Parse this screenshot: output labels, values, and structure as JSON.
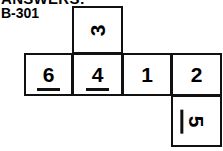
{
  "header": {
    "answers_heading": "ANSWERS:",
    "code_label": "B-301"
  },
  "diagram": {
    "type": "cube-net",
    "cells": [
      {
        "id": "3",
        "value": "3",
        "row": "top",
        "column": 2,
        "rotation": -90,
        "underlined": false
      },
      {
        "id": "6",
        "value": "6",
        "row": "middle",
        "column": 1,
        "rotation": 0,
        "underlined": true
      },
      {
        "id": "4",
        "value": "4",
        "row": "middle",
        "column": 2,
        "rotation": 0,
        "underlined": true
      },
      {
        "id": "1",
        "value": "1",
        "row": "middle",
        "column": 3,
        "rotation": 0,
        "underlined": false
      },
      {
        "id": "2",
        "value": "2",
        "row": "middle",
        "column": 4,
        "rotation": 0,
        "underlined": false
      },
      {
        "id": "5",
        "value": "5",
        "row": "bottom",
        "column": 4,
        "rotation": 90,
        "underlined": true
      }
    ],
    "colors": {
      "stroke": "#111111",
      "fill": "#ffffff",
      "text": "#000000"
    }
  }
}
